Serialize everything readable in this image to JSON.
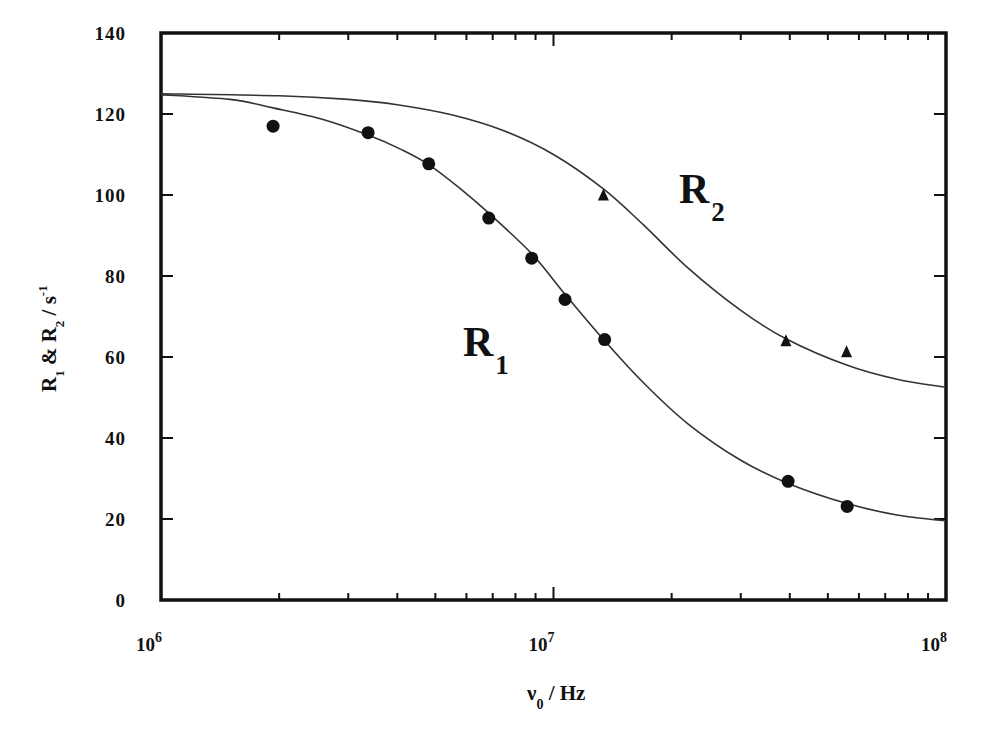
{
  "chart_data": {
    "type": "scatter",
    "title": "",
    "xlabel": "ν0 / Hz",
    "xlabel_main": "ν",
    "xlabel_sub": "0",
    "xlabel_unit": " / Hz",
    "ylabel": "R1 & R2 / s-1",
    "xscale": "log",
    "xlim": [
      1000000,
      100000000
    ],
    "ylim": [
      0,
      140
    ],
    "grid": false,
    "legend": "none (inline labels R1, R2)",
    "x_tick_labels": [
      {
        "base": "10",
        "exp": "6",
        "value": 1000000
      },
      {
        "base": "10",
        "exp": "7",
        "value": 10000000
      },
      {
        "base": "10",
        "exp": "8",
        "value": 100000000
      }
    ],
    "y_ticks": [
      0,
      20,
      40,
      60,
      80,
      100,
      120,
      140
    ],
    "series": [
      {
        "name": "R1",
        "label_main": "R",
        "label_sub": "1",
        "marker": "circle",
        "points": [
          {
            "x": 1930000,
            "y": 117
          },
          {
            "x": 3370000,
            "y": 115.4
          },
          {
            "x": 4810000,
            "y": 107.7
          },
          {
            "x": 6840000,
            "y": 94.3
          },
          {
            "x": 8800000,
            "y": 84.4
          },
          {
            "x": 10700000,
            "y": 74.2
          },
          {
            "x": 13500000,
            "y": 64.3
          },
          {
            "x": 39600000,
            "y": 29.3
          },
          {
            "x": 56000000,
            "y": 23.1
          }
        ],
        "fit_curve": [
          {
            "x": 1000000,
            "y": 124.8
          },
          {
            "x": 1500000,
            "y": 123.6
          },
          {
            "x": 1930000,
            "y": 121.5
          },
          {
            "x": 2600000,
            "y": 118.6
          },
          {
            "x": 3370000,
            "y": 114.8
          },
          {
            "x": 4100000,
            "y": 111.2
          },
          {
            "x": 4810000,
            "y": 107.5
          },
          {
            "x": 5800000,
            "y": 101.5
          },
          {
            "x": 6840000,
            "y": 95.5
          },
          {
            "x": 8800000,
            "y": 85.5
          },
          {
            "x": 10700000,
            "y": 75.5
          },
          {
            "x": 13500000,
            "y": 64.0
          },
          {
            "x": 17000000,
            "y": 53.5
          },
          {
            "x": 22000000,
            "y": 43.5
          },
          {
            "x": 30000000,
            "y": 34.5
          },
          {
            "x": 39600000,
            "y": 28.8
          },
          {
            "x": 56000000,
            "y": 23.8
          },
          {
            "x": 75000000,
            "y": 21.0
          },
          {
            "x": 100000000,
            "y": 19.5
          }
        ]
      },
      {
        "name": "R2",
        "label_main": "R",
        "label_sub": "2",
        "marker": "triangle",
        "points": [
          {
            "x": 13400000,
            "y": 100
          },
          {
            "x": 39100000,
            "y": 64
          },
          {
            "x": 55800000,
            "y": 61.3
          }
        ],
        "fit_curve": [
          {
            "x": 1000000,
            "y": 125.0
          },
          {
            "x": 2000000,
            "y": 124.5
          },
          {
            "x": 3000000,
            "y": 123.6
          },
          {
            "x": 4000000,
            "y": 122.3
          },
          {
            "x": 5500000,
            "y": 119.8
          },
          {
            "x": 7500000,
            "y": 115.8
          },
          {
            "x": 10000000,
            "y": 110.0
          },
          {
            "x": 13400000,
            "y": 101.5
          },
          {
            "x": 17000000,
            "y": 92.5
          },
          {
            "x": 22000000,
            "y": 82.0
          },
          {
            "x": 30000000,
            "y": 71.5
          },
          {
            "x": 39100000,
            "y": 64.5
          },
          {
            "x": 55800000,
            "y": 58.0
          },
          {
            "x": 75000000,
            "y": 54.5
          },
          {
            "x": 100000000,
            "y": 52.5
          }
        ]
      }
    ],
    "annotations": [
      {
        "text": "R1",
        "at_x": 19000000,
        "at_y": 65
      },
      {
        "text": "R2",
        "at_x": 14000000,
        "at_y": 100
      }
    ]
  },
  "axes": {
    "y_label_parts": [
      {
        "text": "R",
        "sub": "1"
      },
      {
        "text": " & "
      },
      {
        "text": "R",
        "sub": "2"
      },
      {
        "text": " / s",
        "sup": "-1"
      }
    ]
  },
  "caption_fragment": "... longitudinal (R1) and transverse (R2) relaxation rates with the L..."
}
